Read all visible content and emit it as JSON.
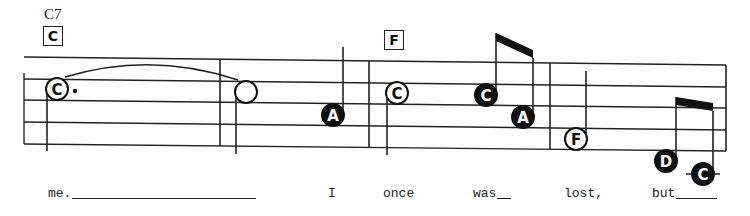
{
  "score": {
    "staff": {
      "left_x": 24,
      "right_x": 726,
      "line_y_left": [
        57,
        79,
        100,
        122,
        144
      ],
      "line_y_right": [
        65,
        87,
        108,
        130,
        151
      ],
      "barlines_x": [
        220,
        369,
        550,
        726
      ]
    },
    "chords": [
      {
        "name": "C7",
        "box_letter": "C",
        "name_x": 44,
        "name_y": 6,
        "box_x": 43,
        "box_y": 26
      },
      {
        "name": "",
        "box_letter": "F",
        "name_x": 0,
        "name_y": 0,
        "box_x": 384,
        "box_y": 30
      }
    ],
    "notes": [
      {
        "letter": "C",
        "fill": "open",
        "duration": "dotted-half",
        "x": 57,
        "y": 89,
        "stem": "down",
        "dot": true
      },
      {
        "letter": "",
        "fill": "open",
        "duration": "half",
        "x": 246,
        "y": 92,
        "stem": "down",
        "dot": false
      },
      {
        "letter": "A",
        "fill": "filled",
        "duration": "quarter",
        "x": 333,
        "y": 115,
        "stem": "up",
        "dot": false
      },
      {
        "letter": "C",
        "fill": "open",
        "duration": "half",
        "x": 397,
        "y": 93,
        "stem": "down",
        "dot": false
      },
      {
        "letter": "C",
        "fill": "filled",
        "duration": "eighth",
        "x": 486,
        "y": 95,
        "stem": "up",
        "dot": false
      },
      {
        "letter": "A",
        "fill": "filled",
        "duration": "eighth",
        "x": 523,
        "y": 117,
        "stem": "up",
        "dot": false
      },
      {
        "letter": "F",
        "fill": "open",
        "duration": "half",
        "x": 576,
        "y": 139,
        "stem": "up",
        "dot": false
      },
      {
        "letter": "D",
        "fill": "filled",
        "duration": "eighth",
        "x": 666,
        "y": 161,
        "stem": "up",
        "dot": false
      },
      {
        "letter": "C",
        "fill": "filled",
        "duration": "eighth",
        "x": 703,
        "y": 174,
        "stem": "up",
        "dot": false,
        "ledger": true
      }
    ],
    "tie": {
      "from_note": 0,
      "to_note": 1
    },
    "lyrics": [
      {
        "text": "me.",
        "x": 48,
        "extender_to": 256
      },
      {
        "text": "I",
        "x": 328
      },
      {
        "text": "once",
        "x": 383
      },
      {
        "text": "was",
        "x": 473,
        "extender_to": 511
      },
      {
        "text": "lost,",
        "x": 564
      },
      {
        "text": "but",
        "x": 652,
        "extender_to": 717
      }
    ]
  }
}
